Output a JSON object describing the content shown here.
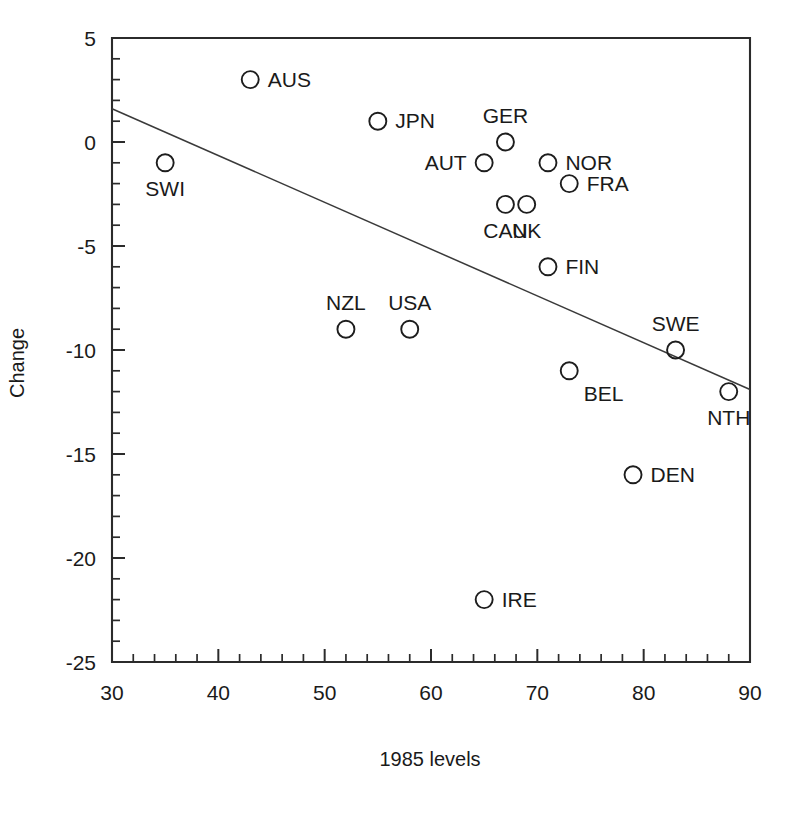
{
  "chart_data": {
    "type": "scatter",
    "title": "",
    "xlabel": "1985 levels",
    "ylabel": "Change",
    "xlim": [
      30,
      90
    ],
    "ylim": [
      -25,
      5
    ],
    "xticks": [
      30,
      40,
      50,
      60,
      70,
      80,
      90
    ],
    "yticks": [
      5,
      0,
      -5,
      -10,
      -15,
      -20,
      -25
    ],
    "xtick_labels": [
      "30",
      "40",
      "50",
      "60",
      "70",
      "80",
      "90"
    ],
    "ytick_labels": [
      "5",
      "0",
      "-5",
      "-10",
      "-15",
      "-20",
      "-25"
    ],
    "xtick_minor_step": 2,
    "ytick_minor_step": 1,
    "grid": false,
    "legend": false,
    "marker": "open-circle",
    "points": [
      {
        "label": "AUS",
        "x": 43,
        "y": 3,
        "label_pos": "right"
      },
      {
        "label": "JPN",
        "x": 55,
        "y": 1,
        "label_pos": "right"
      },
      {
        "label": "SWI",
        "x": 35,
        "y": -1,
        "label_pos": "below"
      },
      {
        "label": "GER",
        "x": 67,
        "y": 0,
        "label_pos": "above"
      },
      {
        "label": "AUT",
        "x": 65,
        "y": -1,
        "label_pos": "left"
      },
      {
        "label": "NOR",
        "x": 71,
        "y": -1,
        "label_pos": "right"
      },
      {
        "label": "FRA",
        "x": 73,
        "y": -2,
        "label_pos": "right"
      },
      {
        "label": "CAN",
        "x": 67,
        "y": -3,
        "label_pos": "below"
      },
      {
        "label": "UK",
        "x": 69,
        "y": -3,
        "label_pos": "below"
      },
      {
        "label": "FIN",
        "x": 71,
        "y": -6,
        "label_pos": "right"
      },
      {
        "label": "NZL",
        "x": 52,
        "y": -9,
        "label_pos": "above"
      },
      {
        "label": "USA",
        "x": 58,
        "y": -9,
        "label_pos": "above"
      },
      {
        "label": "SWE",
        "x": 83,
        "y": -10,
        "label_pos": "above"
      },
      {
        "label": "BEL",
        "x": 73,
        "y": -11,
        "label_pos": "below-right"
      },
      {
        "label": "NTH",
        "x": 88,
        "y": -12,
        "label_pos": "below"
      },
      {
        "label": "DEN",
        "x": 79,
        "y": -16,
        "label_pos": "right"
      },
      {
        "label": "IRE",
        "x": 65,
        "y": -22,
        "label_pos": "right"
      }
    ],
    "fit_line": {
      "name": "regression-line",
      "x_start": 30,
      "y_start": 1.6,
      "x_end": 90,
      "y_end": -11.9
    },
    "colors": {
      "axis": "#2b2b2b",
      "marker_stroke": "#1d1d1d",
      "fit_line": "#3a3a3a",
      "text": "#1a1a1a",
      "background": "#ffffff"
    }
  }
}
